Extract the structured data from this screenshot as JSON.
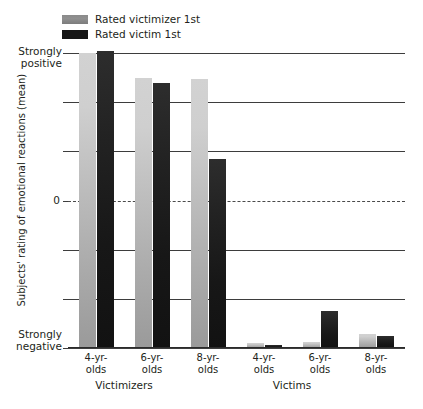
{
  "chart_data": {
    "type": "bar",
    "title": "",
    "xlabel": "",
    "ylabel": "Subjects' rating of emotional reactions (mean)",
    "ylim": [
      -3,
      3
    ],
    "grid": true,
    "legend_position": "top-left",
    "y_axis": {
      "top_label": "Strongly\npositive",
      "bottom_label": "Strongly\nnegative",
      "zero_label": "0",
      "gridline_values": [
        3,
        2,
        1,
        0,
        -1,
        -2,
        -3
      ],
      "zero_is_dashed": true
    },
    "groups": [
      {
        "name": "Victimizers",
        "categories": [
          "4-yr-\nolds",
          "6-yr-\nolds",
          "8-yr-\nolds"
        ]
      },
      {
        "name": "Victims",
        "categories": [
          "4-yr-\nolds",
          "6-yr-\nolds",
          "8-yr-\nolds"
        ]
      }
    ],
    "categories": [
      "Victimizers 4-yr-olds",
      "Victimizers 6-yr-olds",
      "Victimizers 8-yr-olds",
      "Victims 4-yr-olds",
      "Victims 6-yr-olds",
      "Victims 8-yr-olds"
    ],
    "series": [
      {
        "name": "Rated victimizer 1st",
        "color": "#b4b4b4",
        "values": [
          3.0,
          2.5,
          2.48,
          -2.9,
          -2.88,
          -2.72
        ]
      },
      {
        "name": "Rated victim 1st",
        "color": "#161616",
        "values": [
          3.05,
          2.4,
          0.85,
          -2.94,
          -2.25,
          -2.75
        ]
      }
    ]
  },
  "legend": {
    "items": [
      {
        "label": "Rated victimizer 1st",
        "swatch": "victimizer"
      },
      {
        "label": "Rated victim 1st",
        "swatch": "victim"
      }
    ]
  },
  "axis": {
    "y_title": "Subjects' rating of emotional reactions (mean)",
    "y_top": "Strongly\npositive",
    "y_bottom": "Strongly\nnegative",
    "y_zero": "0"
  },
  "x_labels": {
    "c0": "4-yr-\nolds",
    "c1": "6-yr-\nolds",
    "c2": "8-yr-\nolds",
    "c3": "4-yr-\nolds",
    "c4": "6-yr-\nolds",
    "c5": "8-yr-\nolds",
    "g0": "Victimizers",
    "g1": "Victims"
  }
}
